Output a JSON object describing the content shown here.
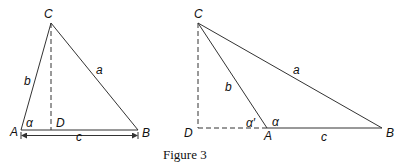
{
  "caption": "Figure 3",
  "figure_left": {
    "vertices": {
      "A": "A",
      "B": "B",
      "C": "C",
      "D": "D"
    },
    "sides": {
      "a": "a",
      "b": "b",
      "c": "c"
    },
    "angle": "α"
  },
  "figure_right": {
    "vertices": {
      "A": "A",
      "B": "B",
      "C": "C",
      "D": "D"
    },
    "sides": {
      "a": "a",
      "b": "b",
      "c": "c"
    },
    "angle": "α",
    "angle_prime": "α′"
  },
  "colors": {
    "line": "#333333",
    "text": "#111111",
    "background": "#ffffff"
  }
}
